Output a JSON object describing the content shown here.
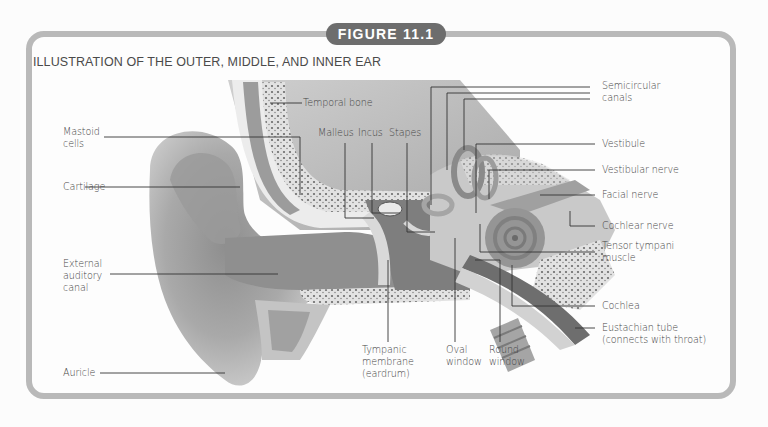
{
  "figure": {
    "badge": "FIGURE 11.1",
    "title": "ILLUSTRATION OF THE OUTER, MIDDLE, AND INNER EAR",
    "colors": {
      "frame": "#b9b9b9",
      "badge_bg": "#6d6d6d",
      "badge_text": "#ffffff",
      "label_text": "#454545"
    }
  },
  "labels": {
    "left": [
      {
        "id": "mastoid-cells",
        "text": "Mastoid\ncells"
      },
      {
        "id": "cartilage",
        "text": "Cartilage"
      },
      {
        "id": "external-auditory-canal",
        "text": "External\nauditory\ncanal"
      },
      {
        "id": "auricle",
        "text": "Auricle"
      }
    ],
    "top": [
      {
        "id": "temporal-bone",
        "text": "Temporal bone"
      },
      {
        "id": "malleus",
        "text": "Malleus"
      },
      {
        "id": "incus",
        "text": "Incus"
      },
      {
        "id": "stapes",
        "text": "Stapes"
      }
    ],
    "right": [
      {
        "id": "semicircular-canals",
        "text": "Semicircular\ncanals"
      },
      {
        "id": "vestibule",
        "text": "Vestibule"
      },
      {
        "id": "vestibular-nerve",
        "text": "Vestibular nerve"
      },
      {
        "id": "facial-nerve",
        "text": "Facial nerve"
      },
      {
        "id": "cochlear-nerve",
        "text": "Cochlear nerve"
      },
      {
        "id": "tensor-tympani-muscle",
        "text": "Tensor tympani\nmuscle"
      },
      {
        "id": "cochlea",
        "text": "Cochlea"
      },
      {
        "id": "eustachian-tube",
        "text": "Eustachian tube\n(connects with throat)"
      }
    ],
    "bottom": [
      {
        "id": "tympanic-membrane",
        "text": "Tympanic\nmembrane\n(eardrum)"
      },
      {
        "id": "oval-window",
        "text": "Oval\nwindow"
      },
      {
        "id": "round-window",
        "text": "Round\nwindow"
      }
    ]
  }
}
